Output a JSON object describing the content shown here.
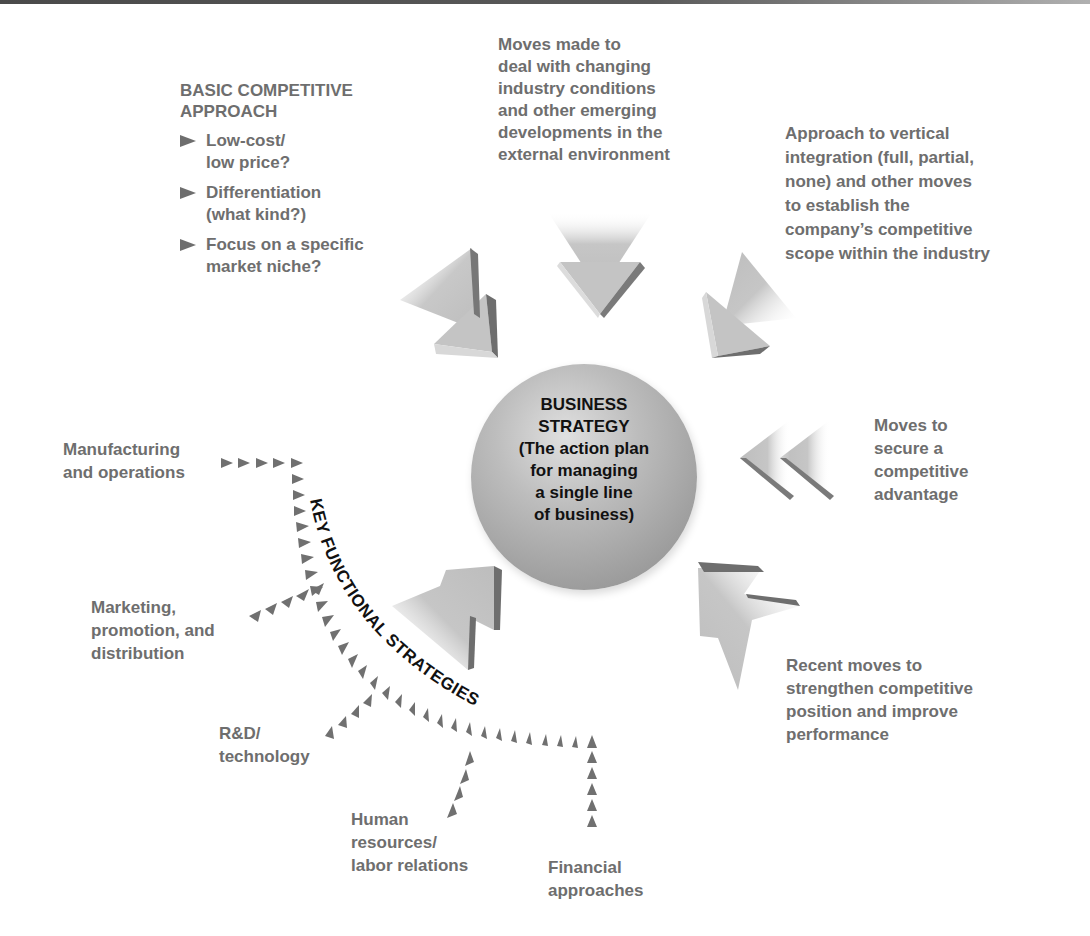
{
  "center": {
    "title_lines": [
      "BUSINESS",
      "STRATEGY"
    ],
    "subtitle_lines": [
      "(The action plan",
      "for managing",
      "a single line",
      "of business)"
    ]
  },
  "basic_approach": {
    "title_lines": [
      "BASIC COMPETITIVE",
      "APPROACH"
    ],
    "bullets": [
      {
        "lines": [
          "Low-cost/",
          "low price?"
        ]
      },
      {
        "lines": [
          "Differentiation",
          "(what kind?)"
        ]
      },
      {
        "lines": [
          "Focus on a specific",
          "market niche?"
        ]
      }
    ]
  },
  "external_moves": {
    "lines": [
      "Moves made to",
      "deal with changing",
      "industry conditions",
      "and other emerging",
      "developments in the",
      "external environment"
    ]
  },
  "vertical_integration": {
    "lines": [
      "Approach to vertical",
      "integration (full, partial,",
      "none) and other moves",
      "to establish the",
      "company’s competitive",
      "scope within the industry"
    ]
  },
  "competitive_advantage": {
    "lines": [
      "Moves to",
      "secure a",
      "competitive",
      "advantage"
    ]
  },
  "recent_moves": {
    "lines": [
      "Recent moves to",
      "strengthen competitive",
      "position and improve",
      "performance"
    ]
  },
  "functional": {
    "arc_label": "KEY FUNCTIONAL STRATEGIES",
    "items": [
      {
        "lines": [
          "Manufacturing",
          "and operations"
        ]
      },
      {
        "lines": [
          "Marketing,",
          "promotion, and",
          "distribution"
        ]
      },
      {
        "lines": [
          "R&D/",
          "technology"
        ]
      },
      {
        "lines": [
          "Human",
          "resources/",
          "labor relations"
        ]
      },
      {
        "lines": [
          "Financial",
          "approaches"
        ]
      }
    ]
  },
  "colors": {
    "label_gray": "#6e6e6e",
    "arrow_gray": "#707070",
    "center_text": "#111111"
  }
}
